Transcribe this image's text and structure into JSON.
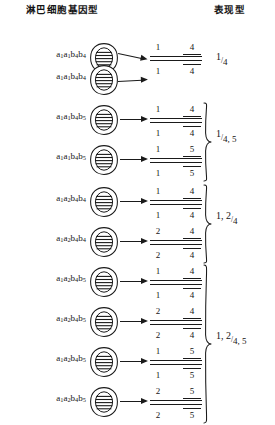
{
  "headers": {
    "genotype": "淋巴细胞基因型",
    "phenotype": "表现型"
  },
  "rows": [
    {
      "id": "row1",
      "genotype_html": "a<sub>1</sub>a<sub>1</sub>b<sub>4</sub>b<sub>4</sub>",
      "genotype_text": "a1a1b4b4",
      "top": 38,
      "frac": {
        "num_left": "1",
        "num_right": "4",
        "den_left": "1",
        "den_right": "4"
      }
    },
    {
      "id": "row2",
      "genotype_html": "a<sub>1</sub>a<sub>1</sub>b<sub>4</sub>b<sub>4</sub>",
      "genotype_text": "a1a1b4b4",
      "top": 60,
      "frac": null
    },
    {
      "id": "row3",
      "genotype_html": "a<sub>1</sub>a<sub>1</sub>b<sub>4</sub>b<sub>5</sub>",
      "genotype_text": "a1a1b4b5",
      "top": 100,
      "frac": {
        "num_left": "1",
        "num_right": "4",
        "den_left": "1",
        "den_right": "4"
      }
    },
    {
      "id": "row4",
      "genotype_html": "a<sub>1</sub>a<sub>1</sub>b<sub>4</sub>b<sub>5</sub>",
      "genotype_text": "a1a1b4b5",
      "top": 140,
      "frac": {
        "num_left": "1",
        "num_right": "5",
        "den_left": "1",
        "den_right": "5"
      }
    },
    {
      "id": "row5",
      "genotype_html": "a<sub>1</sub>a<sub>2</sub>b<sub>4</sub>b<sub>4</sub>",
      "genotype_text": "a1a2b4b4",
      "top": 182,
      "frac": {
        "num_left": "1",
        "num_right": "4",
        "den_left": "1",
        "den_right": "4"
      }
    },
    {
      "id": "row6",
      "genotype_html": "a<sub>1</sub>a<sub>2</sub>b<sub>4</sub>b<sub>4</sub>",
      "genotype_text": "a1a2b4b4",
      "top": 222,
      "frac": {
        "num_left": "2",
        "num_right": "4",
        "den_left": "2",
        "den_right": "4"
      }
    },
    {
      "id": "row7",
      "genotype_html": "a<sub>1</sub>a<sub>2</sub>b<sub>4</sub>b<sub>5</sub>",
      "genotype_text": "a1a2b4b5",
      "top": 262,
      "frac": {
        "num_left": "1",
        "num_right": "4",
        "den_left": "1",
        "den_right": "4"
      }
    },
    {
      "id": "row8",
      "genotype_html": "a<sub>1</sub>a<sub>2</sub>b<sub>4</sub>b<sub>5</sub>",
      "genotype_text": "a1a2b4b5",
      "top": 302,
      "frac": {
        "num_left": "2",
        "num_right": "4",
        "den_left": "2",
        "den_right": "4"
      }
    },
    {
      "id": "row9",
      "genotype_html": "a<sub>1</sub>a<sub>2</sub>b<sub>4</sub>b<sub>5</sub>",
      "genotype_text": "a1a2b4b5",
      "top": 342,
      "frac": {
        "num_left": "1",
        "num_right": "5",
        "den_left": "1",
        "den_right": "5"
      }
    },
    {
      "id": "row10",
      "genotype_html": "a<sub>1</sub>a<sub>2</sub>b<sub>4</sub>b<sub>5</sub>",
      "genotype_text": "a1a2b4b5",
      "top": 382,
      "frac": {
        "num_left": "2",
        "num_right": "5",
        "den_left": "2",
        "den_right": "5"
      }
    }
  ],
  "groups": [
    {
      "id": "group1",
      "phenotype_num": "1",
      "phenotype_den": "4",
      "pheno_top": 51,
      "brace": null
    },
    {
      "id": "group2",
      "phenotype_num": "1",
      "phenotype_den": "4, 5",
      "pheno_top": 128,
      "brace": {
        "top": 102,
        "height": 80
      }
    },
    {
      "id": "group3",
      "phenotype_num": "1, 2",
      "phenotype_den": "4",
      "pheno_top": 210,
      "brace": {
        "top": 184,
        "height": 80
      }
    },
    {
      "id": "group4",
      "phenotype_num": "1, 2",
      "phenotype_den": "4, 5",
      "pheno_top": 330,
      "brace": {
        "top": 264,
        "height": 160
      }
    }
  ],
  "icons": {
    "cell": "lymphocyte-cell-icon",
    "arrow": "arrow-right-icon",
    "brace": "curly-brace-icon"
  },
  "colors": {
    "ink": "#151515",
    "background": "#ffffff"
  }
}
